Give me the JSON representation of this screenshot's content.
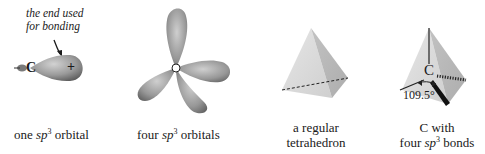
{
  "figure": {
    "panels": [
      {
        "id": "one-orbital",
        "caption_pre": "one ",
        "caption_sp": "sp",
        "caption_sup": "3",
        "caption_post": " orbital",
        "annotation_line1": "the end used",
        "annotation_line2": "for bonding",
        "atom_label": "C",
        "phase_sign": "+"
      },
      {
        "id": "four-orbitals",
        "caption_pre": "four ",
        "caption_sp": "sp",
        "caption_sup": "3",
        "caption_post": " orbitals",
        "atom_label": "C"
      },
      {
        "id": "tetrahedron",
        "caption_line1": "a regular",
        "caption_line2": "tetrahedron"
      },
      {
        "id": "carbon-bonds",
        "caption_line1": "C with",
        "caption_pre": "four ",
        "caption_sp": "sp",
        "caption_sup": "3",
        "caption_post": " bonds",
        "atom_label": "C",
        "angle_label": "109.5°"
      }
    ],
    "colors": {
      "lobe_light": "#c9c9c9",
      "lobe_dark": "#6e6e6e",
      "face_light": "#dcdcdc",
      "face_mid": "#c4c4c4",
      "face_dark": "#a8a8a8",
      "ink": "#1a1a1a"
    }
  }
}
